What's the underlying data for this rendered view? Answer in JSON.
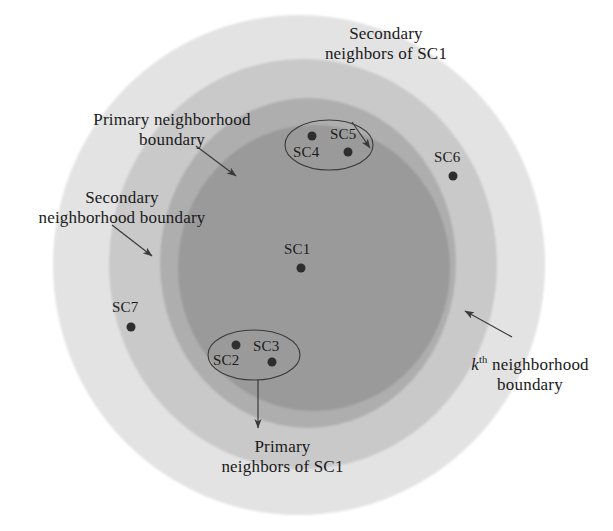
{
  "figure": {
    "background_color": "#ffffff"
  },
  "regions": [
    {
      "name": "kth-neighborhood-region",
      "label": "k th neighborhood boundary",
      "color": "#e3e3e3",
      "cx": 299,
      "cy": 265,
      "rx": 246,
      "ry": 250
    },
    {
      "name": "secondary-neighborhood-region",
      "label": "Secondary neighborhood boundary",
      "color": "#c9c9c9",
      "cx": 303,
      "cy": 264,
      "rx": 194,
      "ry": 205
    },
    {
      "name": "primary-neighborhood-region",
      "label": "Primary neighborhood boundary",
      "color": "#aeaeae",
      "cx": 308,
      "cy": 263,
      "rx": 148,
      "ry": 165
    },
    {
      "name": "core-region",
      "label": "Core region of SC1",
      "color": "#9a9a9a",
      "cx": 314,
      "cy": 268,
      "rx": 136,
      "ry": 143
    }
  ],
  "callouts": {
    "secondary_neighbors": {
      "text": "Secondary\nneighbors of SC1",
      "x": 296,
      "y": 24,
      "width": 180
    },
    "primary_boundary": {
      "text": "Primary neighborhood\nboundary",
      "x": 72,
      "y": 110,
      "width": 200
    },
    "secondary_boundary": {
      "text": "Secondary\nneighborhood boundary",
      "x": 18,
      "y": 188,
      "width": 208
    },
    "kth_boundary": {
      "text_prefix": "k",
      "text_sup": "th",
      "text_rest": " neighborhood",
      "text_line2": "boundary",
      "x": 455,
      "y": 355,
      "width": 150
    },
    "primary_neighbors": {
      "text": "Primary\nneighbors of SC1",
      "x": 195,
      "y": 437,
      "width": 175
    }
  },
  "nodes": [
    {
      "id": "SC1",
      "label": "SC1",
      "cx": 301,
      "cy": 268,
      "lx": 284,
      "ly": 241,
      "r": 4.5
    },
    {
      "id": "SC2",
      "label": "SC2",
      "cx": 236,
      "cy": 345,
      "lx": 213,
      "ly": 352,
      "r": 4.5
    },
    {
      "id": "SC3",
      "label": "SC3",
      "cx": 272,
      "cy": 362,
      "lx": 253,
      "ly": 338,
      "r": 4.5
    },
    {
      "id": "SC4",
      "label": "SC4",
      "cx": 312,
      "cy": 136,
      "lx": 293,
      "ly": 144,
      "r": 4.5
    },
    {
      "id": "SC5",
      "label": "SC5",
      "cx": 348,
      "cy": 152,
      "lx": 330,
      "ly": 126,
      "r": 4.5
    },
    {
      "id": "SC6",
      "label": "SC6",
      "cx": 453,
      "cy": 176,
      "lx": 434,
      "ly": 149,
      "r": 4.5
    },
    {
      "id": "SC7",
      "label": "SC7",
      "cx": 131,
      "cy": 327,
      "lx": 112,
      "ly": 299,
      "r": 4.5
    }
  ],
  "groups": [
    {
      "name": "secondary-neighbors-group",
      "members": [
        "SC4",
        "SC5"
      ],
      "cx": 329,
      "cy": 145,
      "rx": 44,
      "ry": 25
    },
    {
      "name": "primary-neighbors-group",
      "members": [
        "SC2",
        "SC3"
      ],
      "cx": 254,
      "cy": 355,
      "rx": 46,
      "ry": 25
    }
  ],
  "leader_lines": [
    {
      "name": "secondary-neighbors-leader",
      "x1": 352,
      "y1": 122,
      "x2": 370,
      "y2": 148
    },
    {
      "name": "primary-boundary-leader",
      "x1": 196,
      "y1": 146,
      "x2": 236,
      "y2": 176
    },
    {
      "name": "secondary-boundary-leader",
      "x1": 112,
      "y1": 225,
      "x2": 152,
      "y2": 256
    },
    {
      "name": "kth-boundary-leader",
      "x1": 512,
      "y1": 337,
      "x2": 465,
      "y2": 311
    },
    {
      "name": "primary-neighbors-leader",
      "x1": 258,
      "y1": 380,
      "x2": 258,
      "y2": 428
    }
  ],
  "colors": {
    "outer_ring": "#e3e3e3",
    "secondary_ring": "#c9c9c9",
    "primary_ring": "#aeaeae",
    "core": "#9a9a9a",
    "node_fill": "#2e2e2e",
    "text": "#1a1a1a",
    "stroke": "#3a3a3a"
  }
}
